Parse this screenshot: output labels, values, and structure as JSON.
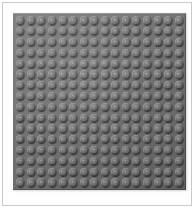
{
  "image": {
    "subject": "lego-baseplate",
    "description": "Gray LEGO building baseplate photographed from directly above on a white background",
    "alt_text": "Gray 16 by 16 stud LEGO baseplate"
  },
  "frame": {
    "border_color": "#c9c9c9",
    "background_color": "#ffffff"
  },
  "baseplate": {
    "color_name": "Medium Stone Grey",
    "plate_color": "#6e6e6e",
    "stud_top_color": "#8d8d8d",
    "stud_shadow_color": "#414141",
    "columns": 16,
    "rows": 16,
    "stud_count": 256
  }
}
